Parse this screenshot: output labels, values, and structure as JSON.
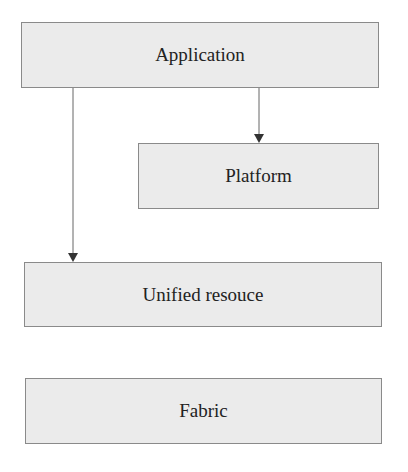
{
  "diagram": {
    "nodes": [
      {
        "id": "application",
        "label": "Application"
      },
      {
        "id": "platform",
        "label": "Platform"
      },
      {
        "id": "unified_resource",
        "label": "Unified resouce"
      },
      {
        "id": "fabric",
        "label": "Fabric"
      }
    ],
    "edges": [
      {
        "from": "application",
        "to": "platform"
      },
      {
        "from": "application",
        "to": "unified_resource"
      }
    ],
    "colors": {
      "box_fill": "#ebebeb",
      "box_border": "#8a8a8a",
      "line": "#555555"
    }
  }
}
